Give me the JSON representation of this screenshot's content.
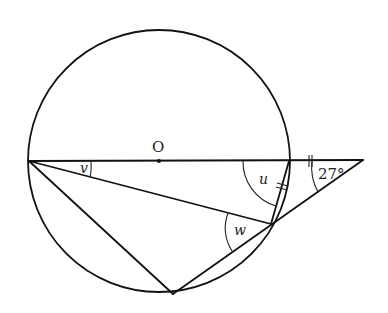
{
  "diagram": {
    "type": "circle-geometry",
    "center_label": "O",
    "angle_labels": {
      "v": "v",
      "u": "u",
      "w": "w",
      "given_angle": "27°"
    },
    "points": {
      "A": {
        "x": 29,
        "y": 161,
        "desc": "left end of diameter"
      },
      "O": {
        "x": 159,
        "y": 161,
        "desc": "center"
      },
      "B": {
        "x": 289,
        "y": 161,
        "desc": "right end of diameter"
      },
      "T": {
        "x": 271,
        "y": 224,
        "desc": "tangent point"
      },
      "C": {
        "x": 173,
        "y": 294,
        "desc": "bottom point on circle"
      },
      "E": {
        "x": 363,
        "y": 160,
        "desc": "external point"
      }
    },
    "circle": {
      "cx": 159,
      "cy": 161,
      "r": 131
    },
    "tick_marks": "equal-length marks on segment B-E and chord B-T"
  }
}
